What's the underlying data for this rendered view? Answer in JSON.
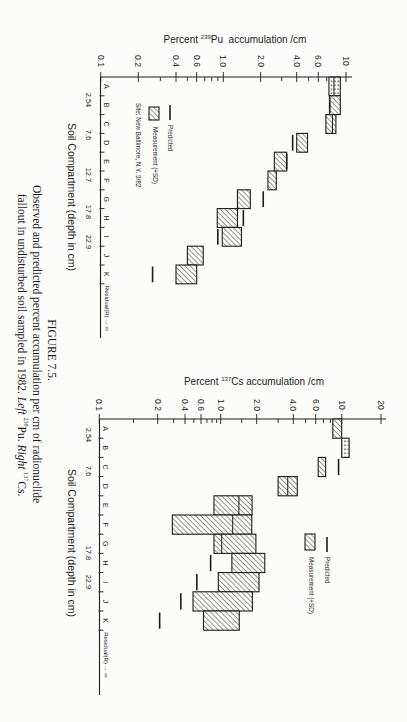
{
  "caption": {
    "label": "FIGURE 7.5.",
    "line1": "Observed and predicted percent accumulation per cm of radionuclide",
    "line2": {
      "text": "fallout in undisturbed soil sampled in 1982. ",
      "left": "Left",
      "left_sup": "239",
      "left_el": "Pu. ",
      "right": "Right",
      "right_sup": "137",
      "right_el": "Cs."
    }
  },
  "chart_data": [
    {
      "type": "bar",
      "orientation": "horizontal",
      "title": "Percent 239Pu accumulation /cm",
      "title_parts": {
        "prefix": "Percent ",
        "sup": "239",
        "nuclide": "Pu",
        "suffix": "  accumulation /cm"
      },
      "xlabel": "Percent 239Pu accumulation /cm",
      "ylabel": "Soil Compartment (depth in cm)",
      "xscale": "log",
      "xlim": [
        0.1,
        10
      ],
      "x_tick_labels": [
        "0.1",
        "0.2",
        "0.4",
        "0.6",
        "1.0",
        "2.0",
        "4.0",
        "6.0",
        "10"
      ],
      "minor_ticks": [
        0.3,
        0.5,
        0.7,
        0.8,
        0.9,
        3,
        5,
        7,
        8,
        9
      ],
      "categories": [
        "A",
        "B",
        "C",
        "D",
        "E",
        "F",
        "G",
        "H",
        "I",
        "J",
        "K"
      ],
      "residual_label": "Residual(R)",
      "residual_arrow": "→",
      "residual_symbol": "∞",
      "depth_labels": [
        "2.54",
        "7.6",
        "12.7",
        "17.8",
        "22.9"
      ],
      "legend": {
        "predicted": "Predicted",
        "measurement": "Measurement (+SD)",
        "site": "Site: New Baltimore, N.Y. 9/82"
      },
      "series": [
        {
          "name": "Measurement (+SD)",
          "values": [
            {
              "low": 7.3,
              "high": 9.0,
              "divider": 8.0,
              "pattern": "dotted"
            },
            {
              "low": 7.4,
              "high": 9.0,
              "pattern": "hatch"
            },
            {
              "low": 6.9,
              "high": 8.3,
              "divider": 7.8,
              "pattern": "hatch"
            },
            {
              "low": 4.0,
              "high": 4.9,
              "pattern": "hatch"
            },
            {
              "low": 2.6,
              "high": 3.3,
              "pattern": "hatch"
            },
            {
              "low": 2.3,
              "high": 2.7,
              "pattern": "hatch"
            },
            {
              "low": 1.3,
              "high": 1.65,
              "pattern": "hatch"
            },
            {
              "low": 0.89,
              "high": 1.3,
              "pattern": "hatch"
            },
            {
              "low": 0.98,
              "high": 1.4,
              "pattern": "hatch"
            },
            {
              "low": 0.5,
              "high": 0.68,
              "pattern": "hatch"
            },
            {
              "low": 0.4,
              "high": 0.6,
              "pattern": "hatch"
            }
          ]
        },
        {
          "name": "Predicted",
          "values": [
            null,
            7.4,
            null,
            3.7,
            3.3,
            null,
            2.1,
            1.45,
            0.9,
            null,
            0.26
          ]
        }
      ]
    },
    {
      "type": "bar",
      "orientation": "horizontal",
      "title": "Percent 137Cs accumulation /cm",
      "title_parts": {
        "prefix": "Percent ",
        "sup": "137",
        "nuclide": "Cs",
        "suffix": " accumulation /cm"
      },
      "xlabel": "Percent 137Cs accumulation /cm",
      "ylabel": "Soil Compartment (depth in cm)",
      "xscale": "log",
      "xlim": [
        0.1,
        20
      ],
      "x_tick_labels": [
        "0.1",
        "0.2",
        "0.4",
        "0.6",
        "1.0",
        "2.0",
        "4.0",
        "6.0",
        "10",
        "20"
      ],
      "minor_ticks": [
        0.15,
        0.3,
        0.5,
        0.7,
        0.8,
        0.9,
        1.5,
        3,
        5,
        7,
        8,
        9
      ],
      "categories": [
        "A",
        "B",
        "C",
        "D",
        "E",
        "F",
        "G",
        "H",
        "I",
        "J",
        "K"
      ],
      "residual_label": "Residual(R)",
      "residual_arrow": "→",
      "residual_symbol": "∞",
      "depth_labels": [
        "2.54",
        "7.6",
        "17.8",
        "22.9"
      ],
      "legend": {
        "predicted": "Predicted",
        "measurement": "Measurement (+SD)"
      },
      "series": [
        {
          "name": "Measurement (+SD)",
          "values": [
            {
              "low": 8.4,
              "high": 10.0,
              "pattern": "hatch"
            },
            {
              "low": 10.0,
              "high": 11.4,
              "pattern": "dotted"
            },
            {
              "low": 6.3,
              "high": 7.3,
              "pattern": "hatch"
            },
            {
              "low": 3.0,
              "high": 4.3,
              "divider": 3.6,
              "pattern": "hatch"
            },
            {
              "low": 0.84,
              "high": 1.83,
              "divider": 1.42,
              "pattern": "hatch"
            },
            {
              "low": 0.29,
              "high": 1.82,
              "divider": 1.26,
              "pattern": "hatch"
            },
            {
              "low": 0.84,
              "high": 1.97,
              "divider": 1.02,
              "pattern": "hatch"
            },
            {
              "low": 1.24,
              "high": 2.33,
              "pattern": "hatch"
            },
            {
              "low": 0.94,
              "high": 2.09,
              "pattern": "hatch"
            },
            {
              "low": 0.49,
              "high": 1.84,
              "pattern": "hatch"
            },
            {
              "low": 0.64,
              "high": 1.43,
              "pattern": "hatch"
            }
          ]
        },
        {
          "name": "Predicted",
          "values": [
            null,
            null,
            9.4,
            null,
            null,
            null,
            null,
            0.77,
            0.54,
            0.36,
            0.21
          ]
        }
      ]
    }
  ]
}
